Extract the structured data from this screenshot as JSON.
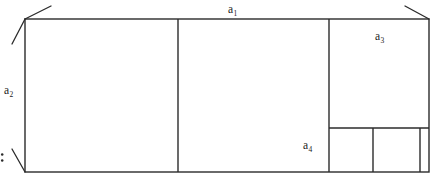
{
  "figure": {
    "background_color": "#ffffff",
    "stroke_color": "#2b2b2b",
    "labels": {
      "a1": {
        "base": "a",
        "sub": "1",
        "text": "a₁",
        "role": "width-of-rectangle"
      },
      "a2": {
        "base": "a",
        "sub": "2",
        "text": "a₂",
        "role": "height-of-rectangle"
      },
      "a3": {
        "base": "a",
        "sub": "3",
        "text": "a₃",
        "role": "third-square"
      },
      "a4": {
        "base": "a",
        "sub": "4",
        "text": "a₄",
        "role": "fourth-square"
      }
    },
    "colon_mark": ":",
    "geometry": {
      "outer_rect": {
        "x": 25,
        "y": 19,
        "width": 404,
        "height": 153
      },
      "vertical_dividers": [
        {
          "name": "divider-square-1",
          "x": 178,
          "y1": 19,
          "y2": 172
        },
        {
          "name": "divider-square-2",
          "x": 329,
          "y1": 19,
          "y2": 172
        },
        {
          "name": "divider-square-4",
          "x": 373,
          "y1": 128,
          "y2": 172
        },
        {
          "name": "divider-square-5",
          "x": 420,
          "y1": 128,
          "y2": 172
        }
      ],
      "horizontal_dividers": [
        {
          "name": "divider-square-3",
          "y": 128,
          "x1": 329,
          "x2": 429
        }
      ],
      "tick_marks": [
        {
          "name": "tick-top-left-upper",
          "x1": 25,
          "y1": 19,
          "x2": 51,
          "y2": 6
        },
        {
          "name": "tick-top-left-lower",
          "x1": 25,
          "y1": 19,
          "x2": 12,
          "y2": 44
        },
        {
          "name": "tick-top-right",
          "x1": 429,
          "y1": 19,
          "x2": 405,
          "y2": 6
        },
        {
          "name": "tick-bottom-left",
          "x1": 25,
          "y1": 172,
          "x2": 12,
          "y2": 149
        }
      ],
      "colon_dots": [
        {
          "cx": 2.0,
          "cy": 154.5,
          "r": 1.2
        },
        {
          "cx": 2.0,
          "cy": 160.5,
          "r": 1.2
        }
      ]
    }
  }
}
